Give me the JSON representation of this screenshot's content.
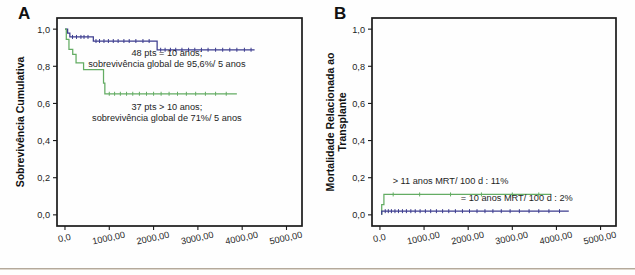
{
  "figure": {
    "panels": [
      {
        "letter": "A",
        "xlabel": "Dias pós-TMO",
        "ylabel": "Sobrevivência Cumulativa",
        "ylabel_lines": [
          "Sobrevivência Cumulativa"
        ],
        "xticks": [
          "0,0",
          "1000,00",
          "2000,00",
          "3000,00",
          "4000,00",
          "5000,00"
        ],
        "xtickvals": [
          0,
          1000,
          2000,
          3000,
          4000,
          5000
        ],
        "yticks": [
          "0,0",
          "0,2",
          "0,4",
          "0,6",
          "0,8",
          "1,0"
        ],
        "ytickvals": [
          0.0,
          0.2,
          0.4,
          0.6,
          0.8,
          1.0
        ],
        "xlim": [
          -180,
          5350
        ],
        "ylim": [
          -0.06,
          1.06
        ],
        "annotations": [
          {
            "id": "annot-blue",
            "lines": [
              "48 pts = 10 anos;",
              "sobrevivência global de 95,6%/ 5 anos"
            ],
            "x": 2300,
            "y": 0.855,
            "color": "#1d1d1d"
          },
          {
            "id": "annot-green",
            "lines": [
              "37 pts > 10 anos;",
              "sobrevivência global de 71%/ 5 anos"
            ],
            "x": 2300,
            "y": 0.565,
            "color": "#1d1d1d"
          }
        ]
      },
      {
        "letter": "B",
        "xlabel": "Dias pós-TMO",
        "ylabel": "Mortalidade Relacionada ao Transplante",
        "ylabel_lines": [
          "Mortalidade Relacionada ao",
          "Transplante"
        ],
        "xticks": [
          "0,0",
          "1000,00",
          "2000,00",
          "3000,00",
          "4000,00",
          "5000,00"
        ],
        "xtickvals": [
          0,
          1000,
          2000,
          3000,
          4000,
          5000
        ],
        "yticks": [
          "0,0",
          "0,2",
          "0,4",
          "0,6",
          "0,8",
          "1,0"
        ],
        "ytickvals": [
          0.0,
          0.2,
          0.4,
          0.6,
          0.8,
          1.0
        ],
        "xlim": [
          -180,
          5350
        ],
        "ylim": [
          -0.06,
          1.06
        ],
        "annotations": [
          {
            "id": "annot-green-b",
            "lines": [
              "> 11 anos MRT/ 100 d : 11%"
            ],
            "x": 1600,
            "y": 0.168,
            "color": "#1d1d1d"
          },
          {
            "id": "annot-blue-b",
            "lines": [
              "= 10 anos MRT/ 100 d : 2%"
            ],
            "x": 3100,
            "y": 0.072,
            "color": "#1d1d1d"
          }
        ]
      }
    ]
  },
  "colors": {
    "blue": "#3d3d8f",
    "green": "#63ac63",
    "axis": "#1a1a1a",
    "text": "#1d1d1d",
    "rule": "#b4a99b",
    "background": "#fefefe"
  },
  "chart_data": [
    {
      "id": "panel-a",
      "type": "line",
      "title": "",
      "subtitle": "Curva de sobrevida de Kaplan-Meier",
      "xlabel": "Dias pós-TMO",
      "ylabel": "Sobrevivência Cumulativa",
      "xlim": [
        0,
        5000
      ],
      "ylim": [
        0.0,
        1.0
      ],
      "grid": false,
      "legend": "none",
      "series": [
        {
          "name": "48 pts = 10 anos",
          "color": "#3d3d8f",
          "label": "48 pts = 10 anos; sobrevivência global de 95,6%/ 5 anos",
          "n": 48,
          "survival_5y": 0.956,
          "step": true,
          "points": [
            [
              0,
              1.0
            ],
            [
              60,
              1.0
            ],
            [
              60,
              0.979
            ],
            [
              110,
              0.979
            ],
            [
              110,
              0.958
            ],
            [
              300,
              0.958
            ],
            [
              300,
              0.958
            ],
            [
              640,
              0.958
            ],
            [
              640,
              0.936
            ],
            [
              2080,
              0.936
            ],
            [
              2080,
              0.889
            ],
            [
              4280,
              0.889
            ]
          ],
          "censored": [
            [
              170,
              0.958
            ],
            [
              260,
              0.958
            ],
            [
              360,
              0.958
            ],
            [
              430,
              0.958
            ],
            [
              520,
              0.958
            ],
            [
              700,
              0.936
            ],
            [
              780,
              0.936
            ],
            [
              880,
              0.936
            ],
            [
              980,
              0.936
            ],
            [
              1090,
              0.936
            ],
            [
              1200,
              0.936
            ],
            [
              1330,
              0.936
            ],
            [
              1450,
              0.936
            ],
            [
              1600,
              0.936
            ],
            [
              1760,
              0.936
            ],
            [
              1900,
              0.936
            ],
            [
              2160,
              0.889
            ],
            [
              2260,
              0.889
            ],
            [
              2380,
              0.889
            ],
            [
              2500,
              0.889
            ],
            [
              2640,
              0.889
            ],
            [
              2790,
              0.889
            ],
            [
              2930,
              0.889
            ],
            [
              3080,
              0.889
            ],
            [
              3230,
              0.889
            ],
            [
              3400,
              0.889
            ],
            [
              3560,
              0.889
            ],
            [
              3720,
              0.889
            ],
            [
              3880,
              0.889
            ],
            [
              4050,
              0.889
            ],
            [
              4200,
              0.889
            ]
          ]
        },
        {
          "name": "37 pts > 10 anos",
          "color": "#63ac63",
          "label": "37 pts > 10 anos; sobrevivência global de 71%/ 5 anos",
          "n": 37,
          "survival_5y": 0.71,
          "step": true,
          "points": [
            [
              0,
              1.0
            ],
            [
              30,
              1.0
            ],
            [
              30,
              0.945
            ],
            [
              90,
              0.945
            ],
            [
              90,
              0.891
            ],
            [
              175,
              0.891
            ],
            [
              175,
              0.864
            ],
            [
              250,
              0.864
            ],
            [
              250,
              0.818
            ],
            [
              420,
              0.818
            ],
            [
              420,
              0.782
            ],
            [
              870,
              0.782
            ],
            [
              870,
              0.71
            ],
            [
              900,
              0.71
            ],
            [
              900,
              0.652
            ],
            [
              3880,
              0.652
            ]
          ],
          "censored": [
            [
              1000,
              0.652
            ],
            [
              1120,
              0.652
            ],
            [
              1250,
              0.652
            ],
            [
              1390,
              0.652
            ],
            [
              1530,
              0.652
            ],
            [
              1680,
              0.652
            ],
            [
              1840,
              0.652
            ],
            [
              2000,
              0.652
            ],
            [
              2170,
              0.652
            ],
            [
              2350,
              0.652
            ],
            [
              2540,
              0.652
            ],
            [
              2740,
              0.652
            ],
            [
              2950,
              0.652
            ],
            [
              3170,
              0.652
            ],
            [
              3400,
              0.652
            ],
            [
              3640,
              0.652
            ]
          ]
        }
      ]
    },
    {
      "id": "panel-b",
      "type": "line",
      "title": "",
      "subtitle": "Incidência cumulativa de mortalidade relacionada ao transplante",
      "xlabel": "Dias pós-TMO",
      "ylabel": "Mortalidade Relacionada ao Transplante",
      "xlim": [
        0,
        5000
      ],
      "ylim": [
        0.0,
        1.0
      ],
      "grid": false,
      "legend": "none",
      "series": [
        {
          "name": "> 11 anos",
          "color": "#63ac63",
          "label": "> 11 anos MRT/ 100 d : 11%",
          "mrt_100d": 0.11,
          "step": true,
          "points": [
            [
              40,
              0.0
            ],
            [
              40,
              0.055
            ],
            [
              90,
              0.055
            ],
            [
              90,
              0.11
            ],
            [
              3880,
              0.11
            ]
          ],
          "censored": [
            [
              300,
              0.11
            ],
            [
              900,
              0.11
            ],
            [
              1600,
              0.11
            ],
            [
              2300,
              0.11
            ],
            [
              3000,
              0.11
            ],
            [
              3600,
              0.11
            ]
          ]
        },
        {
          "name": "= 10 anos",
          "color": "#3d3d8f",
          "label": "= 10 anos MRT/ 100 d : 2%",
          "mrt_100d": 0.02,
          "step": true,
          "points": [
            [
              40,
              0.0
            ],
            [
              40,
              0.02
            ],
            [
              4280,
              0.02
            ]
          ],
          "censored": [
            [
              120,
              0.02
            ],
            [
              190,
              0.02
            ],
            [
              260,
              0.02
            ],
            [
              340,
              0.02
            ],
            [
              420,
              0.02
            ],
            [
              510,
              0.02
            ],
            [
              600,
              0.02
            ],
            [
              700,
              0.02
            ],
            [
              800,
              0.02
            ],
            [
              910,
              0.02
            ],
            [
              1030,
              0.02
            ],
            [
              1150,
              0.02
            ],
            [
              1280,
              0.02
            ],
            [
              1420,
              0.02
            ],
            [
              1560,
              0.02
            ],
            [
              1710,
              0.02
            ],
            [
              1870,
              0.02
            ],
            [
              2030,
              0.02
            ],
            [
              2200,
              0.02
            ],
            [
              2380,
              0.02
            ],
            [
              2560,
              0.02
            ],
            [
              2750,
              0.02
            ],
            [
              2950,
              0.02
            ],
            [
              3160,
              0.02
            ],
            [
              3380,
              0.02
            ],
            [
              3600,
              0.02
            ],
            [
              3830,
              0.02
            ],
            [
              4070,
              0.02
            ]
          ]
        }
      ]
    }
  ]
}
